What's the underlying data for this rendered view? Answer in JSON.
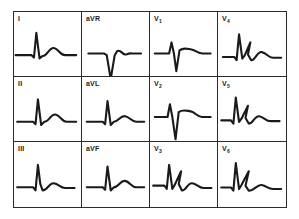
{
  "figure": {
    "grid_rows": 3,
    "grid_columns": 4,
    "border_color": "#2b2b2b",
    "trace_color": "#1a1a1a",
    "background_color": "#ffffff"
  },
  "leads": [
    {
      "id": "I",
      "label": "I",
      "label_base": "I",
      "label_sub": "",
      "row": 1,
      "column": 1,
      "description": "small q, tall upright R wave, broad positive T wave",
      "morphology": "qRs-T upright",
      "path": "M 2,46 L 22,46 L 25,49 L 28,18 L 32,50 L 36,47 C 42,47 44,36 50,37 C 56,38 58,46 64,46 L 78,46"
    },
    {
      "id": "aVR",
      "label": "aVR",
      "label_base": "aVR",
      "label_sub": "",
      "row": 1,
      "column": 2,
      "description": "predominantly negative QS complex with inverted T wave",
      "morphology": "QS negative",
      "path": "M 8,44 L 28,44 L 31,46 L 36,76 L 41,46 L 44,41 C 49,38 51,47 56,45 C 60,43 62,44 66,44 L 74,44"
    },
    {
      "id": "V1",
      "label": "V1",
      "label_base": "V",
      "label_sub": "1",
      "row": 1,
      "column": 3,
      "description": "small r wave followed by deep S wave, small upright T",
      "morphology": "rS pattern",
      "path": "M 6,44 L 24,44 L 27,30 L 30,44 L 33,66 L 37,40 C 42,36 46,38 52,39 C 58,40 60,44 66,44 L 76,44"
    },
    {
      "id": "V4",
      "label": "V4",
      "label_base": "V",
      "label_sub": "4",
      "row": 1,
      "column": 4,
      "description": "tall R wave with slurred downstroke, S wave and broad T wave",
      "morphology": "tall R with notched complex",
      "path": "M 6,48 L 20,48 L 23,52 L 26,20 L 30,50 L 33,46 L 40,30 L 37,45 L 41,52 C 46,53 48,41 54,42 C 60,43 62,49 68,49 L 78,49"
    },
    {
      "id": "II",
      "label": "II",
      "label_base": "II",
      "label_sub": "",
      "row": 2,
      "column": 1,
      "description": "tall upright R wave with broad positive T wave",
      "morphology": "qR-T upright",
      "path": "M 4,48 L 24,48 L 27,51 L 30,20 L 34,52 L 38,48 C 44,48 46,38 52,39 C 58,40 60,48 66,48 L 78,48"
    },
    {
      "id": "aVL",
      "label": "aVL",
      "label_base": "aVL",
      "label_sub": "",
      "row": 2,
      "column": 2,
      "description": "upright R wave with low amplitude positive T wave",
      "morphology": "qR-T upright",
      "path": "M 6,48 L 26,48 L 29,51 L 32,22 L 36,52 L 40,48 C 46,48 48,40 54,41 C 60,42 62,48 68,48 L 78,48"
    },
    {
      "id": "V2",
      "label": "V2",
      "label_base": "V",
      "label_sub": "2",
      "row": 2,
      "column": 3,
      "description": "small r wave with deep prominent S wave, upright T wave",
      "morphology": "rS pattern deep S",
      "path": "M 6,42 L 22,42 L 25,26 L 28,42 L 32,70 L 36,36 C 41,32 45,34 51,35 C 57,36 59,42 65,42 L 76,42"
    },
    {
      "id": "V5",
      "label": "V5",
      "label_base": "V",
      "label_sub": "5",
      "row": 2,
      "column": 4,
      "description": "tall R wave with notched slurred complex and broad T wave",
      "morphology": "tall R notched",
      "path": "M 4,46 L 16,46 L 19,50 L 22,18 L 26,48 L 29,44 L 37,28 L 34,43 L 38,50 C 43,51 45,40 51,41 C 57,42 59,47 65,47 L 76,47"
    },
    {
      "id": "III",
      "label": "III",
      "label_base": "III",
      "label_sub": "",
      "row": 3,
      "column": 1,
      "description": "upright R wave with notched shoulder and positive T wave",
      "morphology": "qR-T upright",
      "path": "M 4,48 L 24,48 L 27,52 L 30,20 L 33,44 L 36,52 C 42,52 44,42 50,43 C 56,44 58,49 64,49 L 76,49"
    },
    {
      "id": "aVF",
      "label": "aVF",
      "label_base": "aVF",
      "label_sub": "",
      "row": 3,
      "column": 2,
      "description": "upright R wave with broad positive T wave",
      "morphology": "qR-T upright",
      "path": "M 6,48 L 26,48 L 29,51 L 32,22 L 36,52 L 40,48 C 46,48 48,39 54,40 C 60,41 62,48 68,48 L 78,48"
    },
    {
      "id": "V3",
      "label": "V3",
      "label_base": "V",
      "label_sub": "3",
      "row": 3,
      "column": 3,
      "description": "transitional complex, notched R with S wave and broad T wave",
      "morphology": "RS transitional notched",
      "path": "M 4,46 L 18,46 L 21,50 L 24,20 L 28,50 L 31,45 L 39,28 L 36,44 L 40,52 C 45,53 47,42 53,43 C 59,44 61,49 67,49 L 77,49"
    },
    {
      "id": "V6",
      "label": "V6",
      "label_base": "V",
      "label_sub": "6",
      "row": 3,
      "column": 4,
      "description": "tall R wave with notched downstroke and broad flat T wave",
      "morphology": "tall R notched",
      "path": "M 4,48 L 16,48 L 19,52 L 22,18 L 26,50 L 29,45 L 38,28 L 34,46 L 38,52 C 44,53 48,44 54,45 C 60,46 62,50 68,50 L 78,50"
    }
  ]
}
